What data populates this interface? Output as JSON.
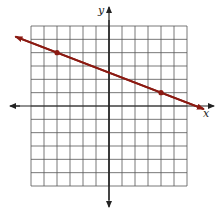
{
  "chart_data": {
    "type": "line",
    "title": "",
    "xlabel": "x",
    "ylabel": "y",
    "xlim": [
      -6,
      6
    ],
    "ylim": [
      -6,
      6
    ],
    "grid": true,
    "grid_step": 1,
    "legend": null,
    "series": [
      {
        "name": "line",
        "color": "#8b1a12",
        "slope": -0.375,
        "intercept": 2.5,
        "marked_points": [
          {
            "x": -4,
            "y": 4
          },
          {
            "x": 4,
            "y": 1
          }
        ],
        "extends_with_arrows": true
      }
    ]
  },
  "axes": {
    "x_label": "x",
    "y_label": "y"
  }
}
